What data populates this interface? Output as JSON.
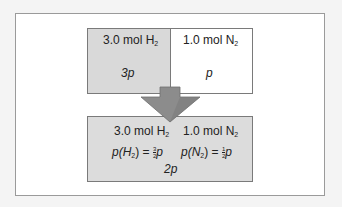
{
  "diagram": {
    "top_left": {
      "amount": "3.0 mol H",
      "sub": "2",
      "pressure": "3p"
    },
    "top_right": {
      "amount": "1.0 mol N",
      "sub": "2",
      "pressure": "p"
    },
    "bottom": {
      "amount_h": "3.0 mol H",
      "sub_h": "2",
      "amount_n": "1.0 mol N",
      "sub_n": "2",
      "ph_prefix": "p(H",
      "ph_sub": "2",
      "ph_eq": ") = ",
      "ph_num": "3",
      "ph_den": "2",
      "ph_suffix": "p",
      "pn_prefix": "p(N",
      "pn_sub": "2",
      "pn_eq": ") = ",
      "pn_num": "1",
      "pn_den": "2",
      "pn_suffix": "p",
      "total": "2p"
    },
    "arrow": {
      "direction": "down",
      "color": "#8c8c8c"
    }
  }
}
